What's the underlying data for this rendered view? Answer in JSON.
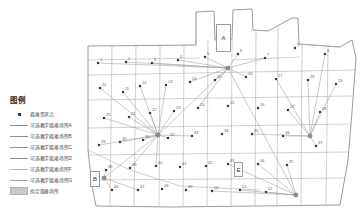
{
  "legend": {
    "title": "图例",
    "items": [
      {
        "key": "point",
        "label": "避难需求点",
        "color": "#3a3a3a"
      },
      {
        "key": "line",
        "label": "可选教学避难场所A",
        "color": "#8a8a8a"
      },
      {
        "key": "line",
        "label": "可选教学避难场所B",
        "color": "#8f8f8f"
      },
      {
        "key": "line",
        "label": "可选教学避难场所C",
        "color": "#949494"
      },
      {
        "key": "line",
        "label": "可选教学避难场所D",
        "color": "#8b8b8b"
      },
      {
        "key": "line",
        "label": "可选教学避难场所F",
        "color": "#b9b9b9"
      },
      {
        "key": "line",
        "label": "可选教学避难场所G",
        "color": "#a3a3a3"
      },
      {
        "key": "swatch",
        "label": "拟定避难场所",
        "color": "#c9c9c9"
      }
    ]
  },
  "map": {
    "area_labels": [
      {
        "id": "A",
        "text": "A",
        "x": 216,
        "y": 24,
        "w": 13,
        "h": 26
      },
      {
        "id": "B",
        "text": "B",
        "x": 90,
        "y": 171,
        "w": 8,
        "h": 14
      },
      {
        "id": "E",
        "text": "E",
        "x": 234,
        "y": 162,
        "w": 7,
        "h": 13
      }
    ],
    "demand_points": [
      {
        "id": "1",
        "x": 98,
        "y": 63,
        "label": "1"
      },
      {
        "id": "2",
        "x": 126,
        "y": 62,
        "label": "2"
      },
      {
        "id": "3",
        "x": 152,
        "y": 63,
        "label": "3"
      },
      {
        "id": "4",
        "x": 178,
        "y": 60,
        "label": "4"
      },
      {
        "id": "5",
        "x": 205,
        "y": 57,
        "label": "5"
      },
      {
        "id": "6",
        "x": 238,
        "y": 54,
        "label": "6"
      },
      {
        "id": "7",
        "x": 265,
        "y": 58,
        "label": "7"
      },
      {
        "id": "8",
        "x": 295,
        "y": 48,
        "label": "8"
      },
      {
        "id": "9",
        "x": 325,
        "y": 54,
        "label": "9"
      },
      {
        "id": "10",
        "x": 100,
        "y": 88,
        "label": "10"
      },
      {
        "id": "11",
        "x": 123,
        "y": 92,
        "label": "11"
      },
      {
        "id": "12",
        "x": 140,
        "y": 86,
        "label": "12"
      },
      {
        "id": "13",
        "x": 166,
        "y": 85,
        "label": "13"
      },
      {
        "id": "14",
        "x": 190,
        "y": 82,
        "label": "14"
      },
      {
        "id": "15",
        "x": 215,
        "y": 80,
        "label": "15"
      },
      {
        "id": "16",
        "x": 246,
        "y": 77,
        "label": "16"
      },
      {
        "id": "17",
        "x": 276,
        "y": 79,
        "label": "17"
      },
      {
        "id": "18",
        "x": 308,
        "y": 80,
        "label": "18"
      },
      {
        "id": "19",
        "x": 336,
        "y": 84,
        "label": "19"
      },
      {
        "id": "20",
        "x": 104,
        "y": 118,
        "label": "20"
      },
      {
        "id": "21",
        "x": 129,
        "y": 117,
        "label": "21"
      },
      {
        "id": "22",
        "x": 150,
        "y": 113,
        "label": "22"
      },
      {
        "id": "23",
        "x": 174,
        "y": 111,
        "label": "23"
      },
      {
        "id": "24",
        "x": 198,
        "y": 108,
        "label": "24"
      },
      {
        "id": "25",
        "x": 228,
        "y": 106,
        "label": "25"
      },
      {
        "id": "26",
        "x": 258,
        "y": 108,
        "label": "26"
      },
      {
        "id": "27",
        "x": 288,
        "y": 110,
        "label": "27"
      },
      {
        "id": "28",
        "x": 320,
        "y": 112,
        "label": "28"
      },
      {
        "id": "29",
        "x": 99,
        "y": 145,
        "label": "29"
      },
      {
        "id": "30",
        "x": 120,
        "y": 142,
        "label": "30"
      },
      {
        "id": "31",
        "x": 143,
        "y": 140,
        "label": "31"
      },
      {
        "id": "32",
        "x": 168,
        "y": 138,
        "label": "32"
      },
      {
        "id": "33",
        "x": 192,
        "y": 136,
        "label": "33"
      },
      {
        "id": "34",
        "x": 222,
        "y": 134,
        "label": "34"
      },
      {
        "id": "35",
        "x": 252,
        "y": 134,
        "label": "35"
      },
      {
        "id": "36",
        "x": 283,
        "y": 136,
        "label": "36"
      },
      {
        "id": "37",
        "x": 316,
        "y": 146,
        "label": "37"
      },
      {
        "id": "38",
        "x": 106,
        "y": 170,
        "label": "38"
      },
      {
        "id": "39",
        "x": 130,
        "y": 168,
        "label": "39"
      },
      {
        "id": "40",
        "x": 156,
        "y": 166,
        "label": "40"
      },
      {
        "id": "41",
        "x": 180,
        "y": 167,
        "label": "41"
      },
      {
        "id": "42",
        "x": 206,
        "y": 166,
        "label": "42"
      },
      {
        "id": "43",
        "x": 228,
        "y": 164,
        "label": "43"
      },
      {
        "id": "44",
        "x": 258,
        "y": 164,
        "label": "44"
      },
      {
        "id": "45",
        "x": 287,
        "y": 165,
        "label": "45"
      },
      {
        "id": "46",
        "x": 112,
        "y": 190,
        "label": "46"
      },
      {
        "id": "47",
        "x": 138,
        "y": 190,
        "label": "47"
      },
      {
        "id": "48",
        "x": 162,
        "y": 189,
        "label": "48"
      },
      {
        "id": "49",
        "x": 186,
        "y": 190,
        "label": "49"
      },
      {
        "id": "50",
        "x": 212,
        "y": 191,
        "label": "50"
      },
      {
        "id": "51",
        "x": 240,
        "y": 190,
        "label": "51"
      },
      {
        "id": "52",
        "x": 266,
        "y": 192,
        "label": "52"
      }
    ],
    "hubs": [
      {
        "id": "hub-a",
        "x": 228,
        "y": 68,
        "label": "A"
      },
      {
        "id": "hub-c",
        "x": 158,
        "y": 135,
        "label": "C"
      },
      {
        "id": "hub-d",
        "x": 310,
        "y": 136,
        "label": "D"
      },
      {
        "id": "hub-f",
        "x": 296,
        "y": 195,
        "label": "F"
      },
      {
        "id": "hub-b",
        "x": 104,
        "y": 178,
        "label": "B"
      }
    ],
    "routes": [
      {
        "from": "hub-a",
        "to": [
          98,
          63
        ]
      },
      {
        "from": "hub-a",
        "to": [
          126,
          62
        ]
      },
      {
        "from": "hub-a",
        "to": [
          152,
          63
        ]
      },
      {
        "from": "hub-a",
        "to": [
          178,
          60
        ]
      },
      {
        "from": "hub-a",
        "to": [
          205,
          57
        ]
      },
      {
        "from": "hub-a",
        "to": [
          238,
          54
        ]
      },
      {
        "from": "hub-a",
        "to": [
          265,
          58
        ]
      },
      {
        "from": "hub-a",
        "to": [
          190,
          82
        ]
      },
      {
        "from": "hub-a",
        "to": [
          215,
          80
        ]
      },
      {
        "from": "hub-a",
        "to": [
          246,
          77
        ]
      },
      {
        "from": "hub-a",
        "to": [
          198,
          108
        ]
      },
      {
        "from": "hub-a",
        "to": [
          158,
          135
        ]
      },
      {
        "from": "hub-c",
        "to": [
          100,
          88
        ]
      },
      {
        "from": "hub-c",
        "to": [
          123,
          92
        ]
      },
      {
        "from": "hub-c",
        "to": [
          140,
          86
        ]
      },
      {
        "from": "hub-c",
        "to": [
          166,
          85
        ]
      },
      {
        "from": "hub-c",
        "to": [
          104,
          118
        ]
      },
      {
        "from": "hub-c",
        "to": [
          129,
          117
        ]
      },
      {
        "from": "hub-c",
        "to": [
          150,
          113
        ]
      },
      {
        "from": "hub-c",
        "to": [
          174,
          111
        ]
      },
      {
        "from": "hub-c",
        "to": [
          99,
          145
        ]
      },
      {
        "from": "hub-c",
        "to": [
          120,
          142
        ]
      },
      {
        "from": "hub-c",
        "to": [
          143,
          140
        ]
      },
      {
        "from": "hub-c",
        "to": [
          168,
          138
        ]
      },
      {
        "from": "hub-c",
        "to": [
          130,
          168
        ]
      },
      {
        "from": "hub-c",
        "to": [
          156,
          166
        ]
      },
      {
        "from": "hub-c",
        "to": [
          192,
          136
        ]
      },
      {
        "from": "hub-c",
        "to": [
          104,
          178
        ]
      },
      {
        "from": "hub-d",
        "to": [
          276,
          79
        ]
      },
      {
        "from": "hub-d",
        "to": [
          308,
          80
        ]
      },
      {
        "from": "hub-d",
        "to": [
          336,
          84
        ]
      },
      {
        "from": "hub-d",
        "to": [
          288,
          110
        ]
      },
      {
        "from": "hub-d",
        "to": [
          320,
          112
        ]
      },
      {
        "from": "hub-d",
        "to": [
          283,
          136
        ]
      },
      {
        "from": "hub-d",
        "to": [
          316,
          146
        ]
      },
      {
        "from": "hub-d",
        "to": [
          252,
          134
        ]
      },
      {
        "from": "hub-d",
        "to": [
          325,
          54
        ]
      },
      {
        "from": "hub-f",
        "to": [
          258,
          164
        ]
      },
      {
        "from": "hub-f",
        "to": [
          287,
          165
        ]
      },
      {
        "from": "hub-f",
        "to": [
          240,
          190
        ]
      },
      {
        "from": "hub-f",
        "to": [
          266,
          192
        ]
      },
      {
        "from": "hub-f",
        "to": [
          212,
          191
        ]
      },
      {
        "from": "hub-f",
        "to": [
          228,
          164
        ]
      },
      {
        "from": "hub-f",
        "to": [
          228,
          68
        ]
      },
      {
        "from": "hub-b",
        "to": [
          106,
          170
        ]
      },
      {
        "from": "hub-b",
        "to": [
          112,
          190
        ]
      },
      {
        "from": "hub-b",
        "to": [
          138,
          190
        ]
      }
    ],
    "shaded_parcels": [
      {
        "x": 196,
        "y": 12,
        "w": 18,
        "h": 34
      },
      {
        "x": 221,
        "y": 60,
        "w": 22,
        "h": 16
      },
      {
        "x": 140,
        "y": 127,
        "w": 24,
        "h": 14
      },
      {
        "x": 226,
        "y": 158,
        "w": 18,
        "h": 16
      },
      {
        "x": 148,
        "y": 186,
        "w": 18,
        "h": 12
      },
      {
        "x": 286,
        "y": 188,
        "w": 16,
        "h": 12
      }
    ]
  },
  "style": {
    "parcel_stroke": "#a8a8a8",
    "boundary_stroke": "#8e8e8e",
    "route_stroke": "#9a9a9a",
    "point_fill": "#3a3a3a",
    "shade_fill": "#d6d6d6",
    "background": "#ffffff"
  }
}
